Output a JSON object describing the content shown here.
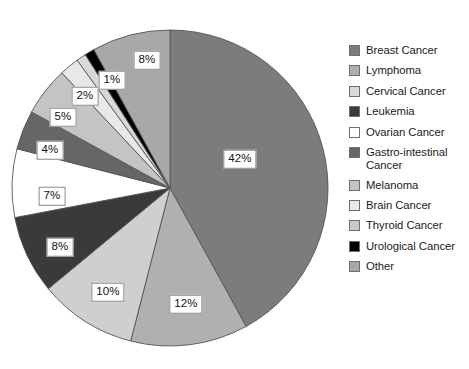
{
  "chart_data": {
    "type": "pie",
    "title": "",
    "subtitle": "",
    "xlabel": "",
    "ylabel": "",
    "legend_position": "right",
    "grid": false,
    "start_angle_deg": 0,
    "direction": "clockwise",
    "categories": [
      "Breast Cancer",
      "Lymphoma",
      "Cervical Cancer",
      "Leukemia",
      "Ovarian Cancer",
      "Gastro-intestinal Cancer",
      "Melanoma",
      "Brain Cancer",
      "Thyroid Cancer",
      "Urological Cancer",
      "Other"
    ],
    "values": [
      42,
      12,
      10,
      8,
      7,
      4,
      5,
      2,
      1,
      1,
      8
    ],
    "value_labels": [
      "42%",
      "12%",
      "10%",
      "8%",
      "7%",
      "4%",
      "5%",
      "2%",
      "1%",
      "1%",
      "8%"
    ],
    "colors": [
      "#7c7c7c",
      "#b0b0b0",
      "#cfcfcf",
      "#3a3a3a",
      "#ffffff",
      "#666666",
      "#c4c4c4",
      "#e8e8e8",
      "#d8d8d8",
      "#000000",
      "#a8a8a8"
    ],
    "slices": [
      {
        "label": "Breast Cancer",
        "value": 42,
        "display": "42%",
        "color": "#7c7c7c",
        "label_shown": true,
        "label_x": 240,
        "label_y": 159
      },
      {
        "label": "Lymphoma",
        "value": 12,
        "display": "12%",
        "color": "#b0b0b0",
        "label_shown": true,
        "label_x": 186,
        "label_y": 304
      },
      {
        "label": "Cervical Cancer",
        "value": 10,
        "display": "10%",
        "color": "#cfcfcf",
        "label_shown": true,
        "label_x": 108,
        "label_y": 292
      },
      {
        "label": "Leukemia",
        "value": 8,
        "display": "8%",
        "color": "#3a3a3a",
        "label_shown": true,
        "label_x": 60,
        "label_y": 247
      },
      {
        "label": "Ovarian Cancer",
        "value": 7,
        "display": "7%",
        "color": "#ffffff",
        "label_shown": true,
        "label_x": 52,
        "label_y": 196
      },
      {
        "label": "Gastro-intestinal Cancer",
        "value": 4,
        "display": "4%",
        "color": "#666666",
        "label_shown": true,
        "label_x": 50,
        "label_y": 150
      },
      {
        "label": "Melanoma",
        "value": 5,
        "display": "5%",
        "color": "#c4c4c4",
        "label_shown": true,
        "label_x": 63,
        "label_y": 117
      },
      {
        "label": "Brain Cancer",
        "value": 2,
        "display": "2%",
        "color": "#e8e8e8",
        "label_shown": true,
        "label_x": 85,
        "label_y": 96
      },
      {
        "label": "Thyroid Cancer",
        "value": 1,
        "display": "",
        "color": "#d8d8d8",
        "label_shown": false,
        "label_x": 0,
        "label_y": 0
      },
      {
        "label": "Urological Cancer",
        "value": 1,
        "display": "1%",
        "color": "#000000",
        "label_shown": true,
        "label_x": 112,
        "label_y": 80
      },
      {
        "label": "Other",
        "value": 8,
        "display": "8%",
        "color": "#a8a8a8",
        "label_shown": true,
        "label_x": 147,
        "label_y": 60
      }
    ],
    "geometry": {
      "cx": 170,
      "cy": 188,
      "r": 158
    }
  },
  "legend": {
    "items": [
      {
        "label": "Breast Cancer",
        "color": "#7c7c7c"
      },
      {
        "label": "Lymphoma",
        "color": "#b0b0b0"
      },
      {
        "label": "Cervical Cancer",
        "color": "#d8d8d8"
      },
      {
        "label": "Leukemia",
        "color": "#3a3a3a"
      },
      {
        "label": "Ovarian Cancer",
        "color": "#ffffff"
      },
      {
        "label": "Gastro-intestinal Cancer",
        "color": "#666666"
      },
      {
        "label": "Melanoma",
        "color": "#c4c4c4"
      },
      {
        "label": "Brain Cancer",
        "color": "#e8e8e8"
      },
      {
        "label": "Thyroid Cancer",
        "color": "#c9c9c9"
      },
      {
        "label": "Urological Cancer",
        "color": "#000000"
      },
      {
        "label": "Other",
        "color": "#a8a8a8"
      }
    ]
  }
}
